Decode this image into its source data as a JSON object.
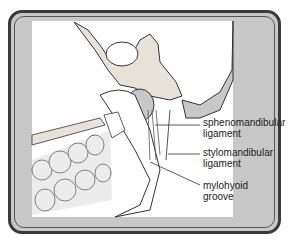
{
  "figure": {
    "labels": [
      {
        "id": "sphenomandibular",
        "line1": "sphenomandibular",
        "line2": "ligament"
      },
      {
        "id": "stylomandibular",
        "line1": "stylomandibular",
        "line2": "ligament"
      },
      {
        "id": "mylohyoid",
        "line1": "mylohyoid",
        "line2": "groove"
      }
    ]
  },
  "colors": {
    "frame_fill": "#c8c8c8",
    "frame_border": "#3a3a3a",
    "panel": "#ffffff",
    "ink": "#222222"
  }
}
